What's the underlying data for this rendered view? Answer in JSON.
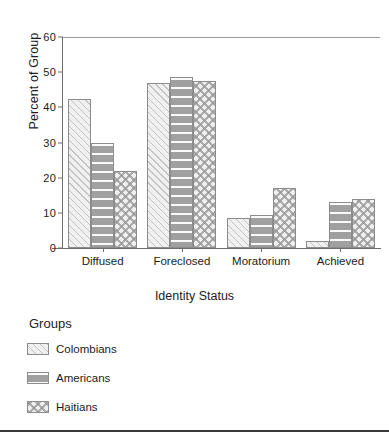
{
  "chart_data": {
    "type": "bar",
    "title": "",
    "xlabel": "Identity Status",
    "ylabel": "Percent of Group",
    "ylim": [
      0,
      60
    ],
    "yticks": [
      0,
      10,
      20,
      30,
      40,
      50,
      60
    ],
    "ytick_labels": [
      "0",
      "10",
      "20",
      "30",
      "40",
      "50",
      "60"
    ],
    "grid": false,
    "legend_position": "below-axes-left",
    "legend_title": "Groups",
    "categories": [
      "Diffused",
      "Foreclosed",
      "Moratorium",
      "Achieved"
    ],
    "series": [
      {
        "name": "Colombians",
        "pattern": "diagonal-hatch",
        "color": "#f0f0f0",
        "values": [
          42.5,
          47,
          8.5,
          2
        ]
      },
      {
        "name": "Americans",
        "pattern": "horizontal-stripes",
        "color": "#a0a0a0",
        "values": [
          30,
          48.5,
          9.5,
          13
        ]
      },
      {
        "name": "Haitians",
        "pattern": "cross-hatch",
        "color": "#efefef",
        "values": [
          22,
          47.5,
          17,
          14
        ]
      }
    ]
  },
  "axes": {
    "y_title": "Percent of Group",
    "x_title": "Identity Status"
  },
  "legend": {
    "title": "Groups",
    "entries": [
      {
        "label": "Colombians"
      },
      {
        "label": "Americans"
      },
      {
        "label": "Haitians"
      }
    ]
  }
}
